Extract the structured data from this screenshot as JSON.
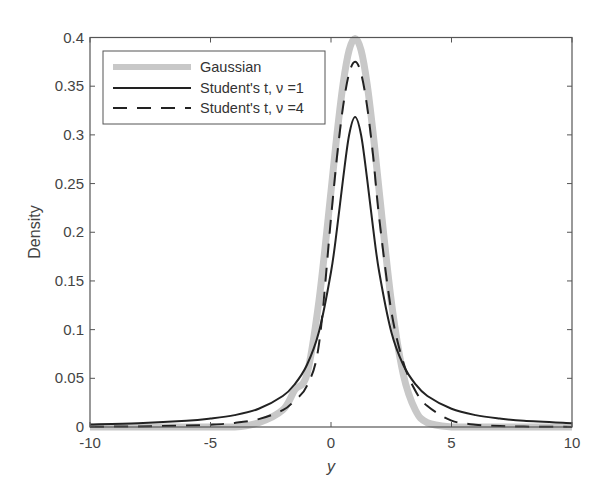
{
  "chart_data": {
    "type": "line",
    "title": "",
    "xlabel": "y",
    "ylabel": "Density",
    "xlim": [
      -10,
      10
    ],
    "ylim": [
      0,
      0.4
    ],
    "grid": false,
    "legend_position": "upper left",
    "xticks": [
      -10,
      -5,
      0,
      5,
      10
    ],
    "xtick_labels": [
      "-10",
      "-5",
      "0",
      "5",
      "10"
    ],
    "yticks": [
      0,
      0.05,
      0.1,
      0.15,
      0.2,
      0.25,
      0.3,
      0.35,
      0.4
    ],
    "ytick_labels": [
      "0",
      "0.05",
      "0.1",
      "0.15",
      "0.2",
      "0.25",
      "0.3",
      "0.35",
      "0.4"
    ],
    "x": [
      -10,
      -8,
      -6,
      -5,
      -4,
      -3,
      -2,
      -1.5,
      -1,
      -0.5,
      0,
      0.25,
      0.5,
      0.75,
      1,
      1.25,
      1.5,
      1.75,
      2,
      2.5,
      3,
      3.5,
      4,
      5,
      6,
      7,
      8,
      10
    ],
    "series": [
      {
        "name": "Gaussian",
        "style": "thick-gray",
        "color": "#c8c8c8",
        "values": [
          0.0,
          0.0,
          0.0,
          0.0,
          0.0,
          0.0044,
          0.0175,
          0.0381,
          0.054,
          0.1295,
          0.242,
          0.301,
          0.352,
          0.3867,
          0.3989,
          0.3867,
          0.352,
          0.301,
          0.242,
          0.1295,
          0.054,
          0.0175,
          0.0044,
          0.0001,
          0.0,
          0.0,
          0.0,
          0.0
        ]
      },
      {
        "name": "Student's t, ν=1",
        "style": "solid",
        "color": "#222222",
        "values": [
          0.0026,
          0.0039,
          0.0064,
          0.0087,
          0.0122,
          0.0187,
          0.0318,
          0.0441,
          0.0637,
          0.0979,
          0.1592,
          0.2037,
          0.2546,
          0.2996,
          0.3183,
          0.2996,
          0.2546,
          0.2037,
          0.1592,
          0.0979,
          0.0637,
          0.0441,
          0.0318,
          0.0187,
          0.0122,
          0.0087,
          0.0064,
          0.0039
        ]
      },
      {
        "name": "Student's t, ν=4",
        "style": "dashed",
        "color": "#222222",
        "values": [
          0.0003,
          0.0006,
          0.0015,
          0.0024,
          0.0042,
          0.0081,
          0.0173,
          0.0275,
          0.0422,
          0.0848,
          0.2147,
          0.2779,
          0.329,
          0.363,
          0.375,
          0.363,
          0.329,
          0.2779,
          0.2147,
          0.1194,
          0.0664,
          0.0373,
          0.0215,
          0.0066,
          0.0024,
          0.0009,
          0.0004,
          0.0001
        ]
      }
    ]
  },
  "legend": {
    "items": [
      {
        "label": "Gaussian"
      },
      {
        "label": "Student's t,  ν =1"
      },
      {
        "label": "Student's t,  ν =4"
      }
    ]
  },
  "axes": {
    "xlabel": "y",
    "ylabel": "Density"
  },
  "colors": {
    "gaussian": "#c8c8c8",
    "t_curves": "#222222",
    "axis": "#555555"
  }
}
